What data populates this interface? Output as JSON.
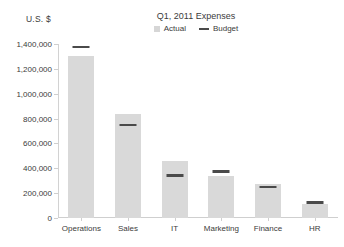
{
  "chart_data": {
    "type": "bar",
    "title": "Q1, 2011 Expenses",
    "ylabel": "U.S. $",
    "xlabel": "",
    "categories": [
      "Operations",
      "Sales",
      "IT",
      "Marketing",
      "Finance",
      "HR"
    ],
    "series": [
      {
        "name": "Actual",
        "values": [
          1300000,
          840000,
          455000,
          340000,
          275000,
          110000
        ]
      },
      {
        "name": "Budget",
        "values": [
          1375000,
          750000,
          340000,
          375000,
          250000,
          125000
        ]
      }
    ],
    "ylim": [
      0,
      1400000
    ],
    "ytick_values": [
      0,
      200000,
      400000,
      600000,
      800000,
      1000000,
      1200000,
      1400000
    ],
    "ytick_labels": [
      "0",
      "200,000",
      "400,000",
      "600,000",
      "800,000",
      "1,000,000",
      "1,200,000",
      "1,400,000"
    ],
    "grid": false,
    "legend": [
      "Actual",
      "Budget"
    ],
    "legend_position": "top-center",
    "colors": {
      "actual_bar": "#d9d9d9",
      "budget_marker": "#4a4a4a",
      "axis": "#cfcfcf",
      "text": "#3b3b3b",
      "background": "#ffffff"
    }
  }
}
